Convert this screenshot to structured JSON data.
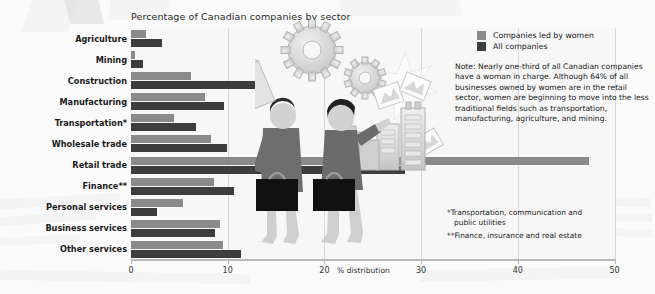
{
  "chart_data": {
    "type": "bar",
    "title": "Percentage of Canadian companies by sector",
    "xlabel": "% distribution",
    "ylabel": "",
    "orientation": "horizontal",
    "grid": true,
    "xlim": [
      0,
      50
    ],
    "xticks": [
      0,
      10,
      20,
      30,
      40,
      50
    ],
    "xtick_labels": [
      "0",
      "10",
      "20",
      "30",
      "40",
      "50"
    ],
    "legend_position": "top-right",
    "categories": [
      "Agriculture",
      "Mining",
      "Construction",
      "Manufacturing",
      "Transportation*",
      "Wholesale trade",
      "Retail trade",
      "Finance**",
      "Personal services",
      "Business services",
      "Other services"
    ],
    "series": [
      {
        "name": "Companies led by women",
        "color": "#8a8a8a",
        "values": [
          1.6,
          0.4,
          6.2,
          7.7,
          4.4,
          8.3,
          47.4,
          8.6,
          5.4,
          9.2,
          9.5
        ]
      },
      {
        "name": "All companies",
        "color": "#3d3d3d",
        "values": [
          3.2,
          1.2,
          13.3,
          9.6,
          6.7,
          9.9,
          28.3,
          10.6,
          2.7,
          8.7,
          11.4
        ]
      }
    ]
  },
  "legend": {
    "items": [
      {
        "label": "Companies led by women",
        "color": "#8a8a8a"
      },
      {
        "label": "All companies",
        "color": "#3d3d3d"
      }
    ]
  },
  "note": {
    "text": "Note: Nearly one-third of all Canadian companies have a woman in charge. Although 64% of all businesses owned by women are in the retail sector, women are beginning to move into the less traditional fields such as transportation, manufacturing, agriculture, and mining."
  },
  "footnotes": {
    "one": "*Transportation, communication and",
    "one_cont": "public utilities",
    "two": "**Finance, insurance and real estate"
  },
  "illustration": {
    "elements": [
      "gear-large-icon",
      "gear-small-icon",
      "person-carrying-box-icon",
      "person-with-briefcase-icon",
      "briefcase-icon",
      "office-buildings-icon",
      "floating-documents-icon",
      "starburst-icon"
    ]
  }
}
